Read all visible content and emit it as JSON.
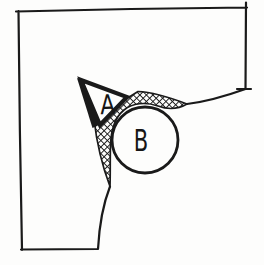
{
  "figure": {
    "labels": {
      "triangle_region": "A",
      "circle_region": "B"
    },
    "colors": {
      "ink": "#1a1a1a",
      "paper": "#fcfcfb"
    }
  }
}
